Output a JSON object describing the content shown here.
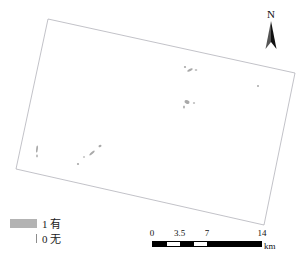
{
  "map": {
    "title": "",
    "background_color": "#ffffff",
    "boundary": {
      "name": "study-area-boundary",
      "stroke_color": "#a8a8b0",
      "fill_color": "#ffffff",
      "corners": [
        [
          48,
          19
        ],
        [
          295,
          73
        ],
        [
          264,
          225
        ],
        [
          16,
          169
        ]
      ]
    },
    "feature_color": "#a9a9a9",
    "features": [
      {
        "name": "patch-north-ridge",
        "cx": 190,
        "cy": 70,
        "rx": 3.0,
        "ry": 1.2,
        "rot": -28
      },
      {
        "name": "patch-north-ridge-b",
        "cx": 196,
        "cy": 70,
        "rx": 1.3,
        "ry": 0.8,
        "rot": 0
      },
      {
        "name": "patch-north-tip",
        "cx": 185,
        "cy": 67,
        "rx": 1.1,
        "ry": 0.9,
        "rot": 0
      },
      {
        "name": "patch-east-dot",
        "cx": 258,
        "cy": 86,
        "rx": 1.0,
        "ry": 1.0,
        "rot": 0
      },
      {
        "name": "patch-center-main",
        "cx": 187,
        "cy": 102,
        "rx": 2.6,
        "ry": 1.8,
        "rot": 20
      },
      {
        "name": "patch-center-east",
        "cx": 194,
        "cy": 103,
        "rx": 1.2,
        "ry": 0.7,
        "rot": 0
      },
      {
        "name": "patch-center-south",
        "cx": 184,
        "cy": 107,
        "rx": 0.9,
        "ry": 1.6,
        "rot": 0
      },
      {
        "name": "patch-west-strip",
        "cx": 37,
        "cy": 149,
        "rx": 0.9,
        "ry": 3.6,
        "rot": 6
      },
      {
        "name": "patch-west-strip-b",
        "cx": 37,
        "cy": 156,
        "rx": 0.8,
        "ry": 1.4,
        "rot": 0
      },
      {
        "name": "patch-midsouth-diag",
        "cx": 92,
        "cy": 153,
        "rx": 3.4,
        "ry": 1.0,
        "rot": -42
      },
      {
        "name": "patch-midsouth-dot",
        "cx": 84,
        "cy": 157,
        "rx": 1.0,
        "ry": 0.8,
        "rot": 0
      },
      {
        "name": "patch-midsouth-ne",
        "cx": 100,
        "cy": 146,
        "rx": 1.6,
        "ry": 1.1,
        "rot": -30
      },
      {
        "name": "patch-south-dot",
        "cx": 78,
        "cy": 164,
        "rx": 1.1,
        "ry": 0.9,
        "rot": 0
      }
    ]
  },
  "north_arrow": {
    "label": "N",
    "icon": "north-arrow-icon"
  },
  "legend": {
    "title": "",
    "items": [
      {
        "value": "1",
        "label": "1 有",
        "symbol": "filled-swatch",
        "color": "#b3b3b3"
      },
      {
        "value": "0",
        "label": "0 无",
        "symbol": "line-swatch",
        "color": "#8c8c8c"
      }
    ]
  },
  "scale_bar": {
    "unit": "km",
    "ticks": [
      "0",
      "3.5",
      "7",
      "14"
    ],
    "tick_positions_pct": [
      0,
      25,
      50,
      100
    ],
    "segments": [
      {
        "fill": "dark",
        "width_pct": 12.5
      },
      {
        "fill": "light",
        "width_pct": 12.5
      },
      {
        "fill": "dark",
        "width_pct": 12.5
      },
      {
        "fill": "light",
        "width_pct": 12.5
      },
      {
        "fill": "dark",
        "width_pct": 50
      }
    ]
  }
}
